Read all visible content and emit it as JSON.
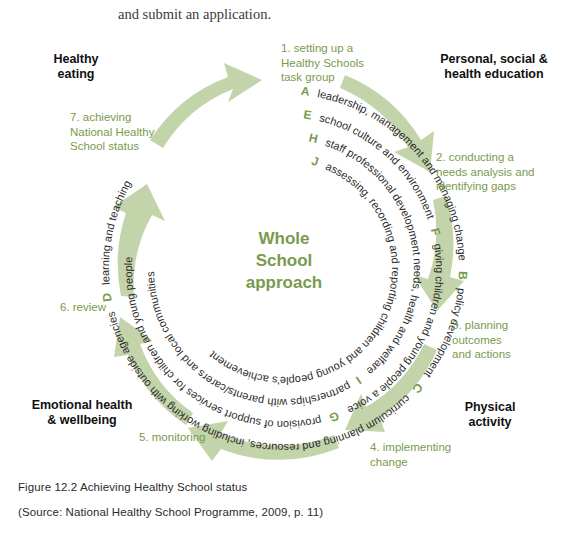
{
  "body_text": {
    "cropped_line": "",
    "submit_line": "and submit an application."
  },
  "figure": {
    "centre_label": "Whole\nSchool\napproach",
    "centre_line1": "Whole",
    "centre_line2": "School",
    "centre_line3": "approach",
    "colors": {
      "green_accent": "#7a9a4e",
      "arrow_green": "#c3d4ab",
      "text_dark": "#2b2b2b",
      "sector_black": "#111111",
      "background": "#ffffff"
    }
  },
  "sectors": [
    {
      "id": "healthy-eating",
      "label": "Healthy\neating",
      "line1": "Healthy",
      "line2": "eating",
      "line3": ""
    },
    {
      "id": "pshe",
      "label": "Personal, social &\nhealth education",
      "line1": "Personal, social &",
      "line2": "health education",
      "line3": ""
    },
    {
      "id": "physical-activity",
      "label": "Physical\nactivity",
      "line1": "Physical",
      "line2": "activity",
      "line3": ""
    },
    {
      "id": "emotional-health",
      "label": "Emotional health\n& wellbeing",
      "line1": "Emotional health",
      "line2": "& wellbeing",
      "line3": ""
    }
  ],
  "steps": [
    {
      "number": "1",
      "id": "step-1",
      "label": "1. setting up a Healthy Schools task group",
      "line1": "1. setting up a",
      "line2": "Healthy Schools",
      "line3": "task group"
    },
    {
      "number": "2",
      "id": "step-2",
      "label": "2. conducting a needs analysis and identifying gaps",
      "line1": "2. conducting a",
      "line2": "needs analysis and",
      "line3": "identifying gaps"
    },
    {
      "number": "3",
      "id": "step-3",
      "label": "3. planning outcomes and actions",
      "line1": "3. planning",
      "line2": "outcomes",
      "line3": "and actions"
    },
    {
      "number": "4",
      "id": "step-4",
      "label": "4. implementing change",
      "line1": "4. implementing",
      "line2": "change",
      "line3": ""
    },
    {
      "number": "5",
      "id": "step-5",
      "label": "5. monitoring",
      "line1": "5. monitoring",
      "line2": "",
      "line3": ""
    },
    {
      "number": "6",
      "id": "step-6",
      "label": "6. review",
      "line1": "6. review",
      "line2": "",
      "line3": ""
    },
    {
      "number": "7",
      "id": "step-7",
      "label": "7. achieving National Healthy School status",
      "line1": "7. achieving",
      "line2": "National Healthy",
      "line3": "School status"
    }
  ],
  "rings": [
    {
      "index": 1,
      "position": "outer",
      "text": "A leadership, management and managing change B policy development C curriculum planning and resources, including working with outside agencies D learning and teaching",
      "items": [
        {
          "letter": "A",
          "text": "leadership, management and managing change"
        },
        {
          "letter": "B",
          "text": "policy development"
        },
        {
          "letter": "C",
          "text": "curriculum planning and resources, including working with outside agencies"
        },
        {
          "letter": "D",
          "text": "learning and teaching"
        }
      ]
    },
    {
      "index": 2,
      "position": "second",
      "text": "E school culture and environment F giving children and young people a voice G provision of support services for children and young people",
      "items": [
        {
          "letter": "E",
          "text": "school culture and environment"
        },
        {
          "letter": "F",
          "text": "giving children and young people a voice"
        },
        {
          "letter": "G",
          "text": "provision of support services for children and young people"
        }
      ]
    },
    {
      "index": 3,
      "position": "third",
      "text": "H staff professional development needs, health and welfare I partnerships with parents/carers and local communities",
      "items": [
        {
          "letter": "H",
          "text": "staff professional development needs, health and welfare"
        },
        {
          "letter": "I",
          "text": "partnerships with parents/carers and local communities"
        }
      ]
    },
    {
      "index": 4,
      "position": "inner",
      "text": "J assessing, recording and reporting children and young people's achievement",
      "items": [
        {
          "letter": "J",
          "text": "assessing, recording and reporting children and young people's achievement"
        }
      ]
    }
  ],
  "ring_strings": {
    "r1_a": "A",
    "r1_a_text": "leadership, management and managing change",
    "r1_b": "B",
    "r1_b_text": "policy development",
    "r1_c": "C",
    "r1_c_text": "curriculum planning and resources, including working with outside agencies",
    "r1_d": "D",
    "r1_d_text": "learning and teaching",
    "r2_e": "E",
    "r2_e_text": "school culture and environment",
    "r2_f": "F",
    "r2_f_text": "giving children and young people a voice",
    "r2_g": "G",
    "r2_g_text": "provision of support services for children and young people",
    "r3_h": "H",
    "r3_h_text": "staff professional development needs, health and welfare",
    "r3_i": "I",
    "r3_i_text": "partnerships with parents/carers and local communities",
    "r4_j": "J",
    "r4_j_text": "assessing, recording and reporting children and young people's achievement"
  },
  "caption": {
    "figure": "Figure 12.2  Achieving Healthy School status",
    "source": "(Source: National Healthy School Programme, 2009, p. 11)"
  }
}
